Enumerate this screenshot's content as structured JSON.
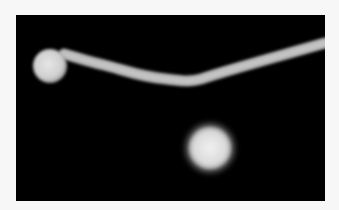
{
  "image": {
    "description": "Fluorescence micrograph: a round cell with an extending filament (germ tube) and a second round cell below",
    "background_color": "#000000",
    "page_color": "#f7f7f7",
    "subject_color": "#d9d9d9",
    "cells": [
      {
        "name": "cell-with-filament",
        "cx": 34,
        "cy": 51,
        "r": 17
      },
      {
        "name": "free-cell",
        "cx": 194,
        "cy": 133,
        "r": 22
      }
    ],
    "filament": {
      "path": "M48 39 C 60 42, 70 46, 88 50 C 105 54, 125 62, 150 64 C 165 66, 175 67, 185 64 C 215 54, 260 42, 309 28",
      "width": 10
    }
  }
}
